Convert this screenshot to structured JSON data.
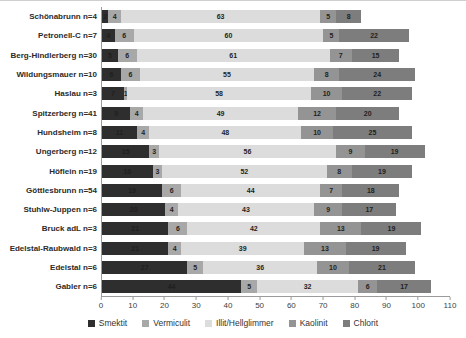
{
  "chart_data": {
    "type": "bar",
    "orientation": "horizontal-stacked",
    "title": "",
    "xlabel": "",
    "ylabel": "",
    "xlim": [
      0,
      110
    ],
    "xticks": [
      0,
      10,
      20,
      30,
      40,
      50,
      60,
      70,
      80,
      90,
      100,
      110
    ],
    "grid": false,
    "legend_position": "bottom",
    "categories": [
      "Schönabrunn n=4",
      "Petronell-C n=7",
      "Berg-Hindlerberg n=30",
      "Wildungsmauer n=10",
      "Haslau n=3",
      "Spitzerberg n=41",
      "Hundsheim n=8",
      "Ungerberg n=12",
      "Höflein n=19",
      "Göttlesbrunn n=54",
      "Stuhlw-Juppen n=6",
      "Bruck adL n=3",
      "Edelstal-Raubwald n=3",
      "Edelstal n=6",
      "Gabler n=6"
    ],
    "series": [
      {
        "name": "Smektit",
        "color": "#2e2e2e",
        "values": [
          2,
          4,
          5,
          6,
          7,
          9,
          11,
          15,
          16,
          19,
          20,
          21,
          21,
          27,
          44
        ]
      },
      {
        "name": "Vermiculit",
        "color": "#a8a8a8",
        "values": [
          4,
          6,
          6,
          6,
          1,
          4,
          4,
          3,
          3,
          6,
          4,
          6,
          4,
          5,
          5
        ]
      },
      {
        "name": "Illit/Hellglimmer",
        "color": "#dcdcdc",
        "values": [
          63,
          60,
          61,
          55,
          58,
          49,
          48,
          56,
          52,
          44,
          43,
          42,
          39,
          36,
          32
        ]
      },
      {
        "name": "Kaolinit",
        "color": "#949494",
        "values": [
          5,
          5,
          7,
          8,
          10,
          12,
          10,
          9,
          8,
          7,
          9,
          13,
          13,
          10,
          6
        ]
      },
      {
        "name": "Chlorit",
        "color": "#7d7d7d",
        "values": [
          8,
          22,
          15,
          24,
          22,
          20,
          25,
          19,
          19,
          18,
          17,
          19,
          19,
          21,
          17
        ]
      }
    ]
  }
}
